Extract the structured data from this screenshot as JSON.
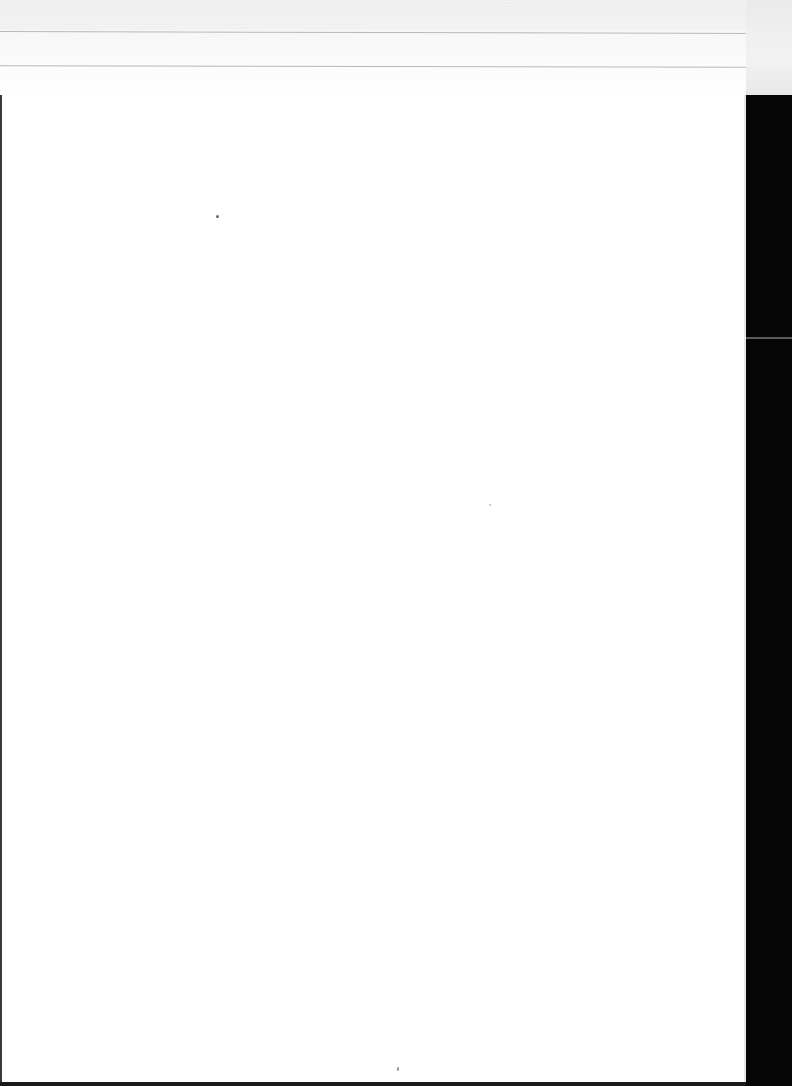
{
  "document": {
    "type": "blank-scanned-page",
    "text": "",
    "colors": {
      "paper": "#ffffff",
      "backdrop": "#050505",
      "edge": "#3a3a3a"
    }
  }
}
